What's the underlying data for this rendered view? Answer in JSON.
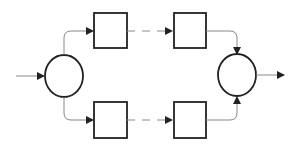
{
  "diagram": {
    "title": "",
    "type": "parallel-path block diagram",
    "colors": {
      "stroke": "#222222",
      "connector": "#888888",
      "background": "#ffffff"
    },
    "nodes": [
      {
        "id": "split",
        "shape": "circle",
        "label": ""
      },
      {
        "id": "top-block-1",
        "shape": "square",
        "label": ""
      },
      {
        "id": "top-block-n",
        "shape": "square",
        "label": ""
      },
      {
        "id": "bottom-block-1",
        "shape": "square",
        "label": ""
      },
      {
        "id": "bottom-block-n",
        "shape": "square",
        "label": ""
      },
      {
        "id": "merge",
        "shape": "circle",
        "label": ""
      }
    ],
    "edges": [
      {
        "from": "input",
        "to": "split",
        "style": "solid"
      },
      {
        "from": "split",
        "to": "top-block-1",
        "style": "solid-curved"
      },
      {
        "from": "top-block-1",
        "to": "top-block-n",
        "style": "dashed"
      },
      {
        "from": "top-block-n",
        "to": "merge",
        "style": "solid-curved"
      },
      {
        "from": "split",
        "to": "bottom-block-1",
        "style": "solid-curved"
      },
      {
        "from": "bottom-block-1",
        "to": "bottom-block-n",
        "style": "dashed"
      },
      {
        "from": "bottom-block-n",
        "to": "merge",
        "style": "solid-curved"
      },
      {
        "from": "merge",
        "to": "output",
        "style": "solid"
      }
    ]
  }
}
